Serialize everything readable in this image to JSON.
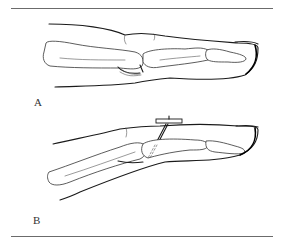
{
  "figure": {
    "panels": [
      {
        "label": "A",
        "description": "Finger lateral view with flexed PIP joint, bones and volar plate shown"
      },
      {
        "label": "B",
        "description": "Finger lateral view with dorsal splint and transarticular pin fixation"
      }
    ]
  },
  "colors": {
    "line": "#1a1a1a",
    "rule": "#6b6b6b",
    "background": "#ffffff"
  }
}
